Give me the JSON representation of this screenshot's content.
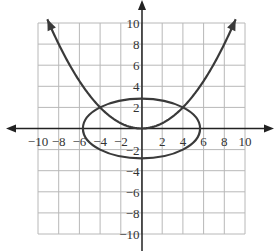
{
  "chart_data": {
    "type": "line",
    "title": "",
    "xlabel": "",
    "ylabel": "",
    "xlim": [
      -10,
      10
    ],
    "ylim": [
      -10,
      10
    ],
    "grid": true,
    "grid_step": 2,
    "x_tick_labels": [
      "-10",
      "-8",
      "-6",
      "-4",
      "-2",
      "2",
      "4",
      "6",
      "8",
      "10"
    ],
    "y_tick_labels": [
      "10",
      "8",
      "6",
      "4",
      "2",
      "-2",
      "-4",
      "-6",
      "-8",
      "-10"
    ],
    "series": [
      {
        "name": "parabola",
        "equation": "x^2 = 8y",
        "points": [
          [
            -9,
            10.1
          ],
          [
            -8,
            8
          ],
          [
            -6,
            4.5
          ],
          [
            -4,
            2
          ],
          [
            -2,
            0.5
          ],
          [
            0,
            0
          ],
          [
            2,
            0.5
          ],
          [
            4,
            2
          ],
          [
            6,
            4.5
          ],
          [
            8,
            8
          ],
          [
            9,
            10.1
          ]
        ],
        "arrows": "both ends"
      },
      {
        "name": "ellipse",
        "equation": "x^2 + 4y^2 = 32",
        "center": [
          0,
          0
        ],
        "semi_axis_x": 5.66,
        "semi_axis_y": 2.83
      }
    ],
    "intersections": [
      [
        -4,
        2
      ],
      [
        4,
        2
      ]
    ]
  },
  "axes": {
    "x_labels": [
      {
        "v": -10,
        "t": "-10"
      },
      {
        "v": -8,
        "t": "-8"
      },
      {
        "v": -6,
        "t": "-6"
      },
      {
        "v": -4,
        "t": "-4"
      },
      {
        "v": -2,
        "t": "-2"
      },
      {
        "v": 2,
        "t": "2"
      },
      {
        "v": 4,
        "t": "4"
      },
      {
        "v": 6,
        "t": "6"
      },
      {
        "v": 8,
        "t": "8"
      },
      {
        "v": 10,
        "t": "10"
      }
    ],
    "y_labels": [
      {
        "v": 10,
        "t": "10"
      },
      {
        "v": 8,
        "t": "8"
      },
      {
        "v": 6,
        "t": "6"
      },
      {
        "v": 4,
        "t": "4"
      },
      {
        "v": 2,
        "t": "2"
      },
      {
        "v": -2,
        "t": "-2"
      },
      {
        "v": -4,
        "t": "-4"
      },
      {
        "v": -6,
        "t": "-6"
      },
      {
        "v": -8,
        "t": "-8"
      },
      {
        "v": -10,
        "t": "-10"
      }
    ]
  },
  "colors": {
    "grid": "#b8b8b8",
    "axis": "#222222",
    "curve": "#3a3a3a"
  }
}
